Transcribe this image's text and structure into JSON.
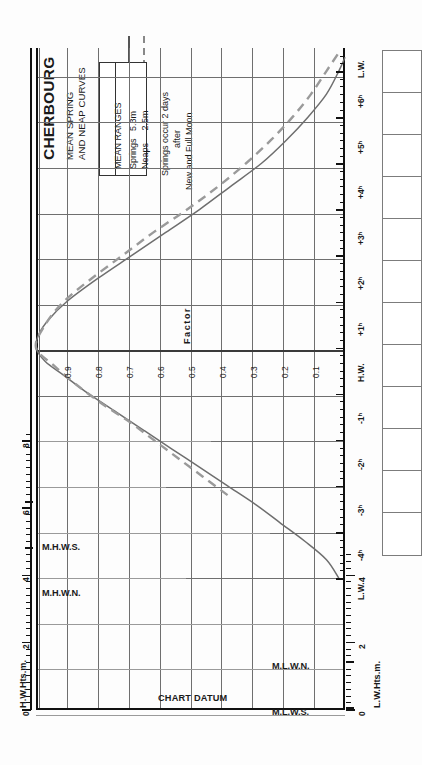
{
  "title": {
    "port": "CHERBOURG",
    "line1": "MEAN SPRING",
    "line2": "AND NEAP CURVES"
  },
  "legend": {
    "heading": "MEAN RANGES",
    "rows": [
      {
        "label": "Springs",
        "value": "5.3m",
        "style": "solid"
      },
      {
        "label": "Neaps",
        "value": "2.5m",
        "style": "dashed"
      }
    ]
  },
  "note": {
    "line1": "Springs occur 2 days",
    "line2": "after",
    "line3": "New and Full Moon"
  },
  "axes": {
    "hw_scale_name": "H.W.Hts.m.",
    "lw_scale_name": "L.W.Hts.m.",
    "hw_ticks": [
      "0",
      "2",
      "4",
      "6",
      "8"
    ],
    "lw_ticks": [
      "0",
      "2",
      "4"
    ],
    "hw_marks": [
      {
        "label": "M.H.W.S.",
        "value": 6.4
      },
      {
        "label": "M.H.W.N.",
        "value": 5.0
      }
    ],
    "lw_marks": [
      {
        "label": "M.L.W.N.",
        "value": 2.7
      },
      {
        "label": "M.L.W.S.",
        "value": 1.2
      }
    ],
    "datum_label": "CHART DATUM",
    "time_labels": [
      "L.W.",
      "-4ʰ",
      "-3ʰ",
      "-2ʰ",
      "-1ʰ",
      "H.W.",
      "+1ʰ",
      "+2ʰ",
      "+3ʰ",
      "+4ʰ",
      "+5ʰ",
      "+6ʰ",
      "L.W."
    ],
    "factor_title": "Factor",
    "factor_labels": [
      "0.9",
      "0.8",
      "0.7",
      "0.6",
      "0.5",
      "0.4",
      "0.3",
      "0.2",
      "0.1"
    ]
  },
  "colors": {
    "spring_curve": "#6e6e6e",
    "neap_curve": "#9a9a9a",
    "grid": "#6f6f6f",
    "axis": "#111111"
  },
  "chart_data": {
    "type": "line",
    "title": "CHERBOURG MEAN SPRING AND NEAP CURVES",
    "xlabel": "Factor",
    "ylabel": "Hours relative to High Water",
    "orientation": "rotated-90",
    "xlim": [
      0,
      1
    ],
    "ylim": [
      -5,
      6.5
    ],
    "grid": true,
    "legend_position": "top-left",
    "series": [
      {
        "name": "Springs",
        "range_m": 5.3,
        "style": "solid",
        "points": [
          {
            "t": -5.0,
            "factor": 0.02
          },
          {
            "t": -4.6,
            "factor": 0.06
          },
          {
            "t": -4.2,
            "factor": 0.13
          },
          {
            "t": -3.8,
            "factor": 0.21
          },
          {
            "t": -3.4,
            "factor": 0.29
          },
          {
            "t": -3.0,
            "factor": 0.38
          },
          {
            "t": -2.6,
            "factor": 0.47
          },
          {
            "t": -2.2,
            "factor": 0.56
          },
          {
            "t": -1.8,
            "factor": 0.65
          },
          {
            "t": -1.4,
            "factor": 0.74
          },
          {
            "t": -1.0,
            "factor": 0.83
          },
          {
            "t": -0.6,
            "factor": 0.91
          },
          {
            "t": -0.3,
            "factor": 0.97
          },
          {
            "t": 0.0,
            "factor": 1.0
          },
          {
            "t": 0.3,
            "factor": 0.99
          },
          {
            "t": 0.6,
            "factor": 0.96
          },
          {
            "t": 1.0,
            "factor": 0.9
          },
          {
            "t": 1.5,
            "factor": 0.8
          },
          {
            "t": 2.0,
            "factor": 0.69
          },
          {
            "t": 2.5,
            "factor": 0.58
          },
          {
            "t": 3.0,
            "factor": 0.47
          },
          {
            "t": 3.5,
            "factor": 0.37
          },
          {
            "t": 4.0,
            "factor": 0.27
          },
          {
            "t": 4.5,
            "factor": 0.19
          },
          {
            "t": 5.0,
            "factor": 0.12
          },
          {
            "t": 5.5,
            "factor": 0.06
          },
          {
            "t": 6.0,
            "factor": 0.02
          },
          {
            "t": 6.3,
            "factor": 0.0
          }
        ]
      },
      {
        "name": "Neaps",
        "range_m": 2.5,
        "style": "dashed",
        "points": [
          {
            "t": -3.2,
            "factor": 0.38
          },
          {
            "t": -2.8,
            "factor": 0.46
          },
          {
            "t": -2.4,
            "factor": 0.54
          },
          {
            "t": -2.0,
            "factor": 0.62
          },
          {
            "t": -1.6,
            "factor": 0.7
          },
          {
            "t": -1.2,
            "factor": 0.79
          },
          {
            "t": -0.8,
            "factor": 0.87
          },
          {
            "t": -0.4,
            "factor": 0.94
          },
          {
            "t": 0.0,
            "factor": 1.0
          },
          {
            "t": 0.5,
            "factor": 0.97
          },
          {
            "t": 1.0,
            "factor": 0.91
          },
          {
            "t": 1.5,
            "factor": 0.82
          },
          {
            "t": 2.0,
            "factor": 0.72
          },
          {
            "t": 2.5,
            "factor": 0.62
          },
          {
            "t": 3.0,
            "factor": 0.51
          },
          {
            "t": 3.5,
            "factor": 0.41
          },
          {
            "t": 4.0,
            "factor": 0.32
          },
          {
            "t": 4.5,
            "factor": 0.24
          },
          {
            "t": 5.0,
            "factor": 0.17
          },
          {
            "t": 5.5,
            "factor": 0.11
          },
          {
            "t": 6.0,
            "factor": 0.06
          },
          {
            "t": 6.4,
            "factor": 0.02
          }
        ]
      }
    ]
  }
}
